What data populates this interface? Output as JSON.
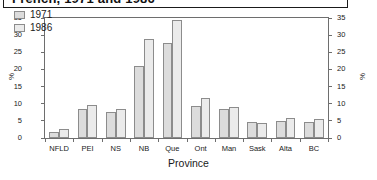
{
  "titlebar": {
    "title": "French, 1971 and 1986"
  },
  "axis": {
    "xlabel": "Province",
    "ylabel_left": "%",
    "ylabel_right": "%"
  },
  "legend": {
    "items": [
      {
        "label": "1971",
        "color": "#dcdcdc"
      },
      {
        "label": "1986",
        "color": "#ebebeb"
      }
    ]
  },
  "chart_data": {
    "type": "bar",
    "title": "French, 1971 and 1986",
    "xlabel": "Province",
    "ylabel": "%",
    "ylim": [
      0,
      35
    ],
    "yticks": [
      0,
      5,
      10,
      15,
      20,
      25,
      30,
      35
    ],
    "grid": false,
    "legend_position": "top-left",
    "categories": [
      "NFLD",
      "PEI",
      "NS",
      "NB",
      "Que",
      "Ont",
      "Man",
      "Sask",
      "Alta",
      "BC"
    ],
    "series": [
      {
        "name": "1971",
        "color": "#dcdcdc",
        "values": [
          1.8,
          8.6,
          7.5,
          21.1,
          27.7,
          9.4,
          8.4,
          4.8,
          4.9,
          4.8
        ]
      },
      {
        "name": "1986",
        "color": "#ebebeb",
        "values": [
          2.7,
          9.5,
          8.4,
          29.0,
          34.4,
          11.8,
          9.0,
          4.3,
          5.9,
          5.6
        ]
      }
    ]
  }
}
